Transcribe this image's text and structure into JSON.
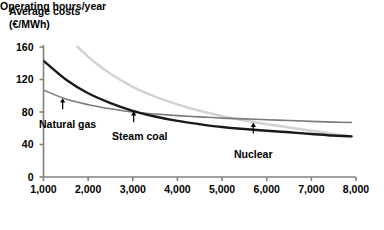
{
  "chart_data": {
    "type": "line",
    "title": "",
    "ylabel": "Average costs (€/MWh)",
    "ylabel_line1": "Average costs",
    "ylabel_line2": "(€/MWh)",
    "xlabel": "Operating hours/year",
    "xlim": [
      1000,
      8000
    ],
    "ylim": [
      0,
      160
    ],
    "xticks": [
      1000,
      2000,
      3000,
      4000,
      5000,
      6000,
      7000,
      8000
    ],
    "xtick_labels": [
      "1,000",
      "2,000",
      "3,000",
      "4,000",
      "5,000",
      "6,000",
      "7,000",
      "8,000"
    ],
    "yticks": [
      0,
      40,
      80,
      120,
      160
    ],
    "ytick_labels": [
      "0",
      "40",
      "80",
      "120",
      "160"
    ],
    "grid": false,
    "legend": "inline-annotations",
    "x": [
      1000,
      1500,
      2000,
      2500,
      3000,
      3500,
      4000,
      4500,
      5000,
      5500,
      6000,
      6500,
      7000,
      7500,
      7900
    ],
    "series": [
      {
        "name": "Natural gas",
        "color": "#7a7a7a",
        "width": 1.6,
        "values": [
          107,
          96,
          89,
          84,
          80,
          77.5,
          75.5,
          74,
          72.5,
          71.5,
          70.5,
          69.5,
          68.5,
          67.5,
          67
        ]
      },
      {
        "name": "Steam coal",
        "color": "#1a1a1a",
        "width": 2.4,
        "values": [
          143,
          120,
          103,
          91,
          81.5,
          74.5,
          69,
          65,
          61.5,
          59,
          57,
          55,
          53,
          51,
          50
        ]
      },
      {
        "name": "Nuclear",
        "color": "#d2d2d2",
        "width": 2.4,
        "values": [
          215,
          176,
          148,
          127,
          111,
          99,
          89.5,
          81.5,
          75,
          69.5,
          65,
          61,
          57,
          53,
          50
        ]
      }
    ],
    "annotations": [
      {
        "label": "Natural gas",
        "series": "Natural gas",
        "x_at": 1430,
        "y_at": 97,
        "label_x": 39,
        "label_y": 118
      },
      {
        "label": "Steam coal",
        "series": "Steam coal",
        "x_at": 3020,
        "y_at": 81,
        "label_x": 112,
        "label_y": 130
      },
      {
        "label": "Nuclear",
        "series": "Nuclear",
        "x_at": 5700,
        "y_at": 67,
        "label_x": 234,
        "label_y": 148
      }
    ]
  },
  "axis": {
    "line_color": "#808080"
  }
}
